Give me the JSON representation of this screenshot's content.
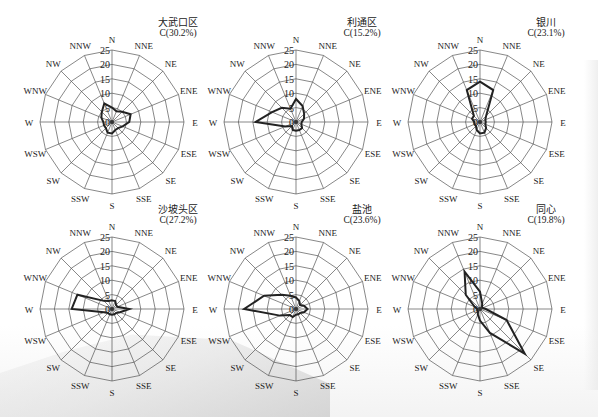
{
  "chart_data": [
    {
      "type": "radar",
      "subtype": "wind-rose",
      "title": "大武口区",
      "calm_label": "C(30.2%)",
      "directions": [
        "N",
        "NNE",
        "NE",
        "ENE",
        "E",
        "ESE",
        "SE",
        "SSE",
        "S",
        "SSW",
        "SW",
        "WSW",
        "W",
        "WNW",
        "NW",
        "NNW"
      ],
      "values": [
        5,
        4,
        5,
        7,
        6,
        4,
        3,
        3,
        4,
        4,
        3,
        3,
        3,
        4,
        5,
        7
      ],
      "rings": [
        0,
        5,
        10,
        15,
        20,
        25
      ],
      "rlim": [
        0,
        25
      ],
      "unit": "%"
    },
    {
      "type": "radar",
      "subtype": "wind-rose",
      "title": "利通区",
      "calm_label": "C(15.2%)",
      "directions": [
        "N",
        "NNE",
        "NE",
        "ENE",
        "E",
        "ESE",
        "SE",
        "SSE",
        "S",
        "SSW",
        "SW",
        "WSW",
        "W",
        "WNW",
        "NW",
        "NNW"
      ],
      "values": [
        8,
        6,
        4,
        3,
        2,
        2,
        3,
        3,
        3,
        3,
        2,
        4,
        14,
        9,
        7,
        5
      ],
      "rings": [
        0,
        5,
        10,
        15,
        20,
        25
      ],
      "rlim": [
        0,
        25
      ],
      "unit": "%"
    },
    {
      "type": "radar",
      "subtype": "wind-rose",
      "title": "银川",
      "calm_label": "C(23.1%)",
      "directions": [
        "N",
        "NNE",
        "NE",
        "ENE",
        "E",
        "ESE",
        "SE",
        "SSE",
        "S",
        "SSW",
        "SW",
        "WSW",
        "W",
        "WNW",
        "NW",
        "NNW"
      ],
      "values": [
        14,
        12,
        3,
        2,
        2,
        2,
        3,
        4,
        4,
        3,
        2,
        2,
        2,
        3,
        3,
        12
      ],
      "rings": [
        0,
        5,
        10,
        15,
        20,
        25
      ],
      "rlim": [
        0,
        25
      ],
      "unit": "%"
    },
    {
      "type": "radar",
      "subtype": "wind-rose",
      "title": "沙坡头区",
      "calm_label": "C(27.2%)",
      "directions": [
        "N",
        "NNE",
        "NE",
        "ENE",
        "E",
        "ESE",
        "SE",
        "SSE",
        "S",
        "SSW",
        "SW",
        "WSW",
        "W",
        "WNW",
        "NW",
        "NNW"
      ],
      "values": [
        3,
        3,
        2,
        2,
        6,
        3,
        2,
        2,
        2,
        2,
        2,
        3,
        14,
        13,
        4,
        3
      ],
      "rings": [
        0,
        5,
        10,
        15,
        20,
        25
      ],
      "rlim": [
        0,
        25
      ],
      "unit": "%"
    },
    {
      "type": "radar",
      "subtype": "wind-rose",
      "title": "盐池",
      "calm_label": "C(23.6%)",
      "directions": [
        "N",
        "NNE",
        "NE",
        "ENE",
        "E",
        "ESE",
        "SE",
        "SSE",
        "S",
        "SSW",
        "SW",
        "WSW",
        "W",
        "WNW",
        "NW",
        "NNW"
      ],
      "values": [
        4,
        3,
        2,
        3,
        4,
        3,
        2,
        2,
        2,
        3,
        3,
        6,
        18,
        12,
        7,
        5
      ],
      "rings": [
        0,
        5,
        10,
        15,
        20,
        25
      ],
      "rlim": [
        0,
        25
      ],
      "unit": "%"
    },
    {
      "type": "radar",
      "subtype": "wind-rose",
      "title": "同心",
      "calm_label": "C(19.8%)",
      "directions": [
        "N",
        "NNE",
        "NE",
        "ENE",
        "E",
        "ESE",
        "SE",
        "SSE",
        "S",
        "SSW",
        "SW",
        "WSW",
        "W",
        "WNW",
        "NW",
        "NNW"
      ],
      "values": [
        6,
        2,
        1,
        1,
        2,
        10,
        22,
        9,
        4,
        2,
        1,
        1,
        1,
        2,
        7,
        14
      ],
      "rings": [
        0,
        5,
        10,
        15,
        20,
        25
      ],
      "rlim": [
        0,
        25
      ],
      "unit": "%"
    }
  ],
  "layout": {
    "panels": [
      {
        "cx": 112,
        "cy": 122
      },
      {
        "cx": 296,
        "cy": 122
      },
      {
        "cx": 480,
        "cy": 122
      },
      {
        "cx": 112,
        "cy": 309
      },
      {
        "cx": 296,
        "cy": 309
      },
      {
        "cx": 480,
        "cy": 309
      }
    ],
    "radius": 72,
    "line_color": "#222222",
    "grid_color": "#555555"
  }
}
